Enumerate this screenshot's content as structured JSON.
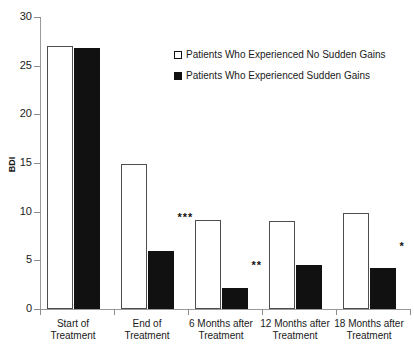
{
  "chart_data": {
    "type": "bar",
    "title": "",
    "xlabel": "",
    "ylabel": "BDI",
    "ylim": [
      0,
      30
    ],
    "yticks": [
      0,
      5,
      10,
      15,
      20,
      25,
      30
    ],
    "grid": false,
    "legend_position": "upper-center-right",
    "categories": [
      "Start of\nTreatment",
      "End of\nTreatment",
      "6 Months after\nTreatment",
      "12 Months after\nTreatment",
      "18 Months after\nTreatment"
    ],
    "series": [
      {
        "name": "Patients Who Experienced No Sudden Gains",
        "color": "#ffffff",
        "edge_color": "#4d4d4d",
        "values": [
          27.0,
          14.9,
          9.1,
          9.0,
          9.9
        ]
      },
      {
        "name": "Patients Who Experienced Sudden Gains",
        "color": "#111111",
        "edge_color": "#111111",
        "values": [
          26.8,
          6.0,
          2.2,
          4.5,
          4.2
        ]
      }
    ],
    "annotations": [
      {
        "category_index": 1,
        "text": "***",
        "value": 10.0
      },
      {
        "category_index": 2,
        "text": "**",
        "value": 5.0
      },
      {
        "category_index": 4,
        "text": "*",
        "value": 7.0
      }
    ]
  },
  "axis": {
    "y_title": "BDI",
    "y_tick_labels": [
      "0",
      "5",
      "10",
      "15",
      "20",
      "25",
      "30"
    ]
  },
  "legend": {
    "items": [
      {
        "label": "Patients Who Experienced No Sudden Gains",
        "marker": "open-square-icon"
      },
      {
        "label": "Patients Who Experienced Sudden Gains",
        "marker": "filled-square-icon"
      }
    ]
  },
  "categories": [
    {
      "line1": "Start of",
      "line2": "Treatment"
    },
    {
      "line1": "End of",
      "line2": "Treatment"
    },
    {
      "line1": "6 Months after",
      "line2": "Treatment"
    },
    {
      "line1": "12 Months after",
      "line2": "Treatment"
    },
    {
      "line1": "18 Months after",
      "line2": "Treatment"
    }
  ],
  "significance": [
    {
      "text": ""
    },
    {
      "text": "***"
    },
    {
      "text": "**"
    },
    {
      "text": ""
    },
    {
      "text": "*"
    }
  ]
}
